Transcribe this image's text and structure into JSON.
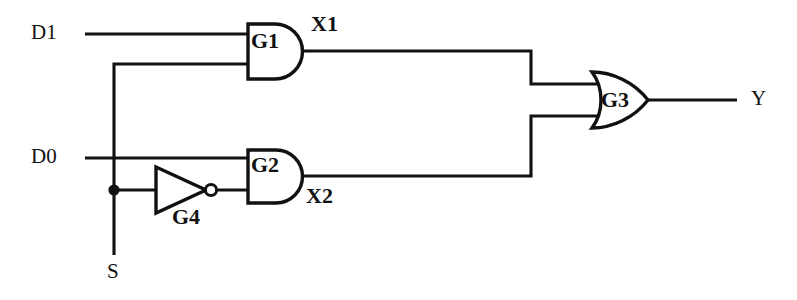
{
  "diagram": {
    "type": "logic-gate-schematic",
    "background_color": "#ffffff",
    "line_color": "#111111"
  },
  "inputs": [
    {
      "name": "D1",
      "label": "D1",
      "x": 38,
      "y": 34
    },
    {
      "name": "D0",
      "label": "D0",
      "x": 38,
      "y": 158
    },
    {
      "name": "S",
      "label": "S",
      "x": 108,
      "y": 272
    }
  ],
  "outputs": [
    {
      "name": "Y",
      "label": "Y",
      "x": 752,
      "y": 98
    }
  ],
  "nets": [
    {
      "name": "X1",
      "label": "X1",
      "x": 312,
      "y": 26
    },
    {
      "name": "X2",
      "label": "X2",
      "x": 308,
      "y": 196
    }
  ],
  "gates": [
    {
      "name": "G1",
      "label": "G1",
      "kind": "AND",
      "label_x": 257,
      "label_y": 41
    },
    {
      "name": "G2",
      "label": "G2",
      "kind": "AND",
      "label_x": 257,
      "label_y": 164
    },
    {
      "name": "G3",
      "label": "G3",
      "kind": "OR",
      "label_x": 602,
      "label_y": 89
    },
    {
      "name": "G4",
      "label": "G4",
      "kind": "NOT",
      "label_x": 173,
      "label_y": 208
    }
  ],
  "geometry": {
    "g1": {
      "x": 248,
      "y": 24,
      "w": 28,
      "h": 55,
      "r": 27.5
    },
    "g2": {
      "x": 248,
      "y": 150,
      "w": 28,
      "h": 53,
      "r": 26.5
    },
    "g3": {
      "x": 592,
      "y": 72,
      "w": 56,
      "h": 56
    },
    "g4": {
      "x": 155,
      "y": 167,
      "w": 50,
      "h": 46,
      "bubble_cx": 211,
      "bubble_cy": 190,
      "bubble_r": 6
    },
    "junction": {
      "cx": 114,
      "cy": 190,
      "r": 5.5
    }
  },
  "wires": [
    {
      "name": "wire-d1-to-g1",
      "path": "M 85 34 L 248 34"
    },
    {
      "name": "wire-s-to-g1",
      "path": "M 114 255 L 114 64 L 248 64"
    },
    {
      "name": "wire-d0-to-g2",
      "path": "M 85 158 L 248 158"
    },
    {
      "name": "wire-junction-to-g4",
      "path": "M 114 190 L 155 190"
    },
    {
      "name": "wire-g4-to-g2",
      "path": "M 217 190 L 248 190"
    },
    {
      "name": "wire-x1-to-g3",
      "path": "M 303 51 L 531 51 L 531 84"
    },
    {
      "name": "wire-x2-to-g3",
      "path": "M 303 176 L 531 176 L 531 116"
    },
    {
      "name": "wire-g3-upper-input",
      "path": "M 531 84 L 597 84"
    },
    {
      "name": "wire-g3-lower-input",
      "path": "M 531 116 L 597 116"
    },
    {
      "name": "wire-g3-to-y",
      "path": "M 648 100 L 737 100"
    }
  ]
}
